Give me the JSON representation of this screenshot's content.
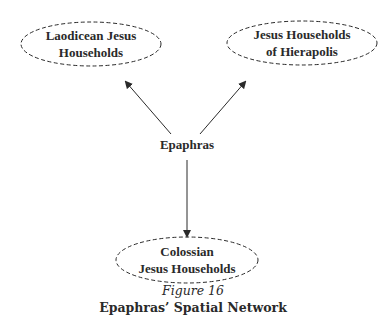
{
  "diagram": {
    "nodes": [
      {
        "id": "laodicea",
        "lines": [
          "Laodicean Jesus",
          "Households"
        ],
        "shape": "dashed-ellipse"
      },
      {
        "id": "hierapolis",
        "lines": [
          "Jesus Households",
          "of Hierapolis"
        ],
        "shape": "dashed-ellipse"
      },
      {
        "id": "epaphras",
        "lines": [
          "Epaphras"
        ],
        "shape": "none"
      },
      {
        "id": "colossae",
        "lines": [
          "Colossian",
          "Jesus Households"
        ],
        "shape": "dashed-ellipse"
      }
    ],
    "edges": [
      {
        "from": "epaphras",
        "to": "laodicea",
        "directed": true
      },
      {
        "from": "epaphras",
        "to": "hierapolis",
        "directed": true
      },
      {
        "from": "epaphras",
        "to": "colossae",
        "directed": true
      }
    ],
    "colors": {
      "stroke": "#2a2a2a",
      "background": "#ffffff"
    }
  },
  "caption": {
    "figure_number": "Figure 16",
    "title": "Epaphras’ Spatial Network"
  }
}
